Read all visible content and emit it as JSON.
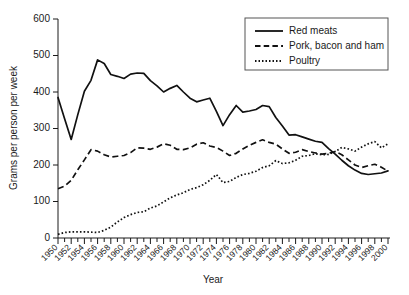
{
  "chart_data": {
    "type": "line",
    "title": "",
    "xlabel": "Year",
    "ylabel": "Grams per person per week",
    "xlim": [
      1950,
      2000
    ],
    "ylim": [
      0,
      600
    ],
    "yticks": [
      0,
      100,
      200,
      300,
      400,
      500,
      600
    ],
    "xticks": [
      1950,
      1952,
      1954,
      1956,
      1958,
      1960,
      1962,
      1964,
      1966,
      1968,
      1970,
      1972,
      1974,
      1976,
      1978,
      1980,
      1982,
      1984,
      1986,
      1988,
      1990,
      1992,
      1994,
      1996,
      1998,
      2000
    ],
    "x_minor_tick_interval": 1,
    "grid": false,
    "legend_position": "top-right",
    "x": [
      1950,
      1951,
      1952,
      1953,
      1954,
      1955,
      1956,
      1957,
      1958,
      1959,
      1960,
      1961,
      1962,
      1963,
      1964,
      1965,
      1966,
      1967,
      1968,
      1969,
      1970,
      1971,
      1972,
      1973,
      1974,
      1975,
      1976,
      1977,
      1978,
      1979,
      1980,
      1981,
      1982,
      1983,
      1984,
      1985,
      1986,
      1987,
      1988,
      1989,
      1990,
      1991,
      1992,
      1993,
      1994,
      1995,
      1996,
      1997,
      1998,
      1999,
      2000
    ],
    "series": [
      {
        "name": "Red meats",
        "style": "solid",
        "values": [
          385,
          327,
          270,
          338,
          402,
          432,
          488,
          478,
          448,
          443,
          437,
          449,
          452,
          451,
          431,
          417,
          400,
          410,
          418,
          400,
          383,
          373,
          378,
          383,
          347,
          308,
          338,
          363,
          345,
          348,
          352,
          363,
          360,
          330,
          307,
          282,
          283,
          277,
          271,
          265,
          262,
          245,
          230,
          213,
          198,
          186,
          177,
          174,
          176,
          178,
          184
        ]
      },
      {
        "name": "Pork, bacon and ham",
        "style": "dashed",
        "values": [
          135,
          142,
          158,
          187,
          214,
          242,
          238,
          228,
          222,
          224,
          226,
          234,
          247,
          246,
          243,
          249,
          258,
          254,
          243,
          242,
          247,
          257,
          261,
          252,
          248,
          238,
          226,
          232,
          244,
          254,
          262,
          269,
          262,
          257,
          244,
          232,
          235,
          242,
          237,
          233,
          230,
          232,
          237,
          228,
          214,
          200,
          193,
          198,
          202,
          194,
          183
        ]
      },
      {
        "name": "Poultry",
        "style": "dotted",
        "values": [
          10,
          15,
          17,
          17,
          17,
          16,
          15,
          21,
          30,
          44,
          56,
          64,
          70,
          72,
          82,
          88,
          99,
          110,
          118,
          124,
          133,
          138,
          146,
          158,
          174,
          152,
          155,
          166,
          174,
          177,
          183,
          193,
          198,
          212,
          204,
          206,
          213,
          224,
          226,
          231,
          228,
          229,
          237,
          248,
          244,
          238,
          249,
          258,
          264,
          247,
          258
        ]
      }
    ]
  },
  "legend": {
    "items": [
      {
        "label": "Red meats"
      },
      {
        "label": "Pork, bacon and ham"
      },
      {
        "label": "Poultry"
      }
    ]
  },
  "axes": {
    "y_title": "Grams per person per week",
    "x_title": "Year"
  }
}
